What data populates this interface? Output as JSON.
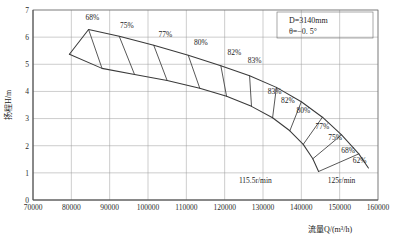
{
  "chart_data": {
    "type": "line",
    "title": "",
    "xlabel": "流量Q/(m³/h)",
    "ylabel": "扬程H/m",
    "xlim": [
      70000,
      160000
    ],
    "ylim": [
      0,
      7
    ],
    "xticks": [
      70000,
      80000,
      90000,
      100000,
      110000,
      120000,
      130000,
      140000,
      150000,
      160000
    ],
    "yticks": [
      0,
      1,
      2,
      3,
      4,
      5,
      6,
      7
    ],
    "grid": true,
    "legend": "none",
    "annotations": {
      "diameter": "D=3140mm",
      "blade_angle": "θ=−0. 5°"
    },
    "speed_lines": [
      {
        "label": "115.5r/min",
        "x": 128000,
        "y": 0.62
      },
      {
        "label": "125r/min",
        "x": 150500,
        "y": 0.62
      }
    ],
    "series": [
      {
        "name": "upper-envelope",
        "points": [
          [
            79500,
            5.37
          ],
          [
            84500,
            6.28
          ],
          [
            92500,
            6.03
          ],
          [
            101500,
            5.7
          ],
          [
            110500,
            5.33
          ],
          [
            119000,
            4.95
          ],
          [
            126500,
            4.58
          ],
          [
            133500,
            4.15
          ],
          [
            140000,
            3.62
          ],
          [
            145500,
            3.05
          ],
          [
            150500,
            2.4
          ],
          [
            155000,
            1.7
          ],
          [
            157500,
            1.18
          ]
        ]
      },
      {
        "name": "lower-envelope",
        "points": [
          [
            79500,
            5.37
          ],
          [
            88000,
            4.85
          ],
          [
            96500,
            4.62
          ],
          [
            105000,
            4.4
          ],
          [
            113500,
            4.12
          ],
          [
            120500,
            3.82
          ],
          [
            127000,
            3.45
          ],
          [
            132500,
            3.03
          ],
          [
            137000,
            2.55
          ],
          [
            140500,
            2.05
          ],
          [
            143000,
            1.52
          ],
          [
            144500,
            1.05
          ]
        ]
      }
    ],
    "speed_curves": [
      {
        "name": "c1",
        "p1": [
          84500,
          6.28
        ],
        "p2": [
          88000,
          4.85
        ]
      },
      {
        "name": "c2",
        "p1": [
          92500,
          6.03
        ],
        "p2": [
          96500,
          4.62
        ]
      },
      {
        "name": "c3",
        "p1": [
          101500,
          5.7
        ],
        "p2": [
          105000,
          4.4
        ]
      },
      {
        "name": "c4",
        "p1": [
          110500,
          5.33
        ],
        "p2": [
          113500,
          4.12
        ]
      },
      {
        "name": "c5",
        "p1": [
          119000,
          4.95
        ],
        "p2": [
          120500,
          3.82
        ]
      },
      {
        "name": "c6",
        "p1": [
          126500,
          4.58
        ],
        "p2": [
          127000,
          3.45
        ]
      },
      {
        "name": "c7",
        "p1": [
          133500,
          4.15
        ],
        "p2": [
          132500,
          3.03
        ]
      },
      {
        "name": "c8",
        "p1": [
          140000,
          3.62
        ],
        "p2": [
          137000,
          2.55
        ]
      },
      {
        "name": "c9",
        "p1": [
          145500,
          3.05
        ],
        "p2": [
          140500,
          2.05
        ]
      },
      {
        "name": "c10",
        "p1": [
          150500,
          2.4
        ],
        "p2": [
          143000,
          1.52
        ]
      },
      {
        "name": "c11",
        "p1": [
          155000,
          1.7
        ],
        "p2": [
          144500,
          1.05
        ]
      }
    ],
    "efficiency_labels": [
      {
        "value": "68%",
        "x": 85500,
        "y": 6.62
      },
      {
        "value": "75%",
        "x": 94500,
        "y": 6.34
      },
      {
        "value": "77%",
        "x": 104500,
        "y": 6.02
      },
      {
        "value": "80%",
        "x": 113800,
        "y": 5.7
      },
      {
        "value": "82%",
        "x": 122500,
        "y": 5.36
      },
      {
        "value": "83%",
        "x": 127800,
        "y": 5.05
      },
      {
        "value": "83%",
        "x": 133000,
        "y": 3.92
      },
      {
        "value": "82%",
        "x": 136500,
        "y": 3.58
      },
      {
        "value": "80%",
        "x": 140500,
        "y": 3.22
      },
      {
        "value": "77%",
        "x": 145500,
        "y": 2.62
      },
      {
        "value": "75%",
        "x": 148800,
        "y": 2.22
      },
      {
        "value": "68%",
        "x": 152200,
        "y": 1.72
      },
      {
        "value": "62%",
        "x": 155200,
        "y": 1.35
      }
    ]
  }
}
